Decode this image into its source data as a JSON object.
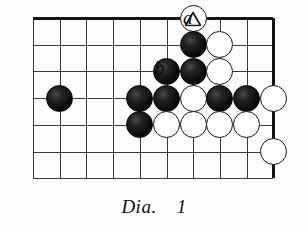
{
  "diagram": {
    "caption_text": "Dia.",
    "caption_number": "1",
    "board": {
      "columns": 10,
      "rows": 7,
      "x_start": 33,
      "y_start": 18,
      "spacing_x": 26.7,
      "spacing_y": 26.7,
      "edge_top_thick": true,
      "edge_right_thick": true,
      "grid_color": "#1a1a1a",
      "background_color": "#fdfdfc"
    },
    "stone_colors": {
      "black": "#0c0c0c",
      "white": "#ffffff",
      "outline": "#151515"
    },
    "stone_diameter": 27,
    "stones": [
      {
        "name": "white-triangle-stone",
        "color": "white",
        "col": 6,
        "row": 0,
        "mark": "triangle"
      },
      {
        "name": "black-stone",
        "color": "black",
        "col": 6,
        "row": 1,
        "mark": ""
      },
      {
        "name": "white-stone",
        "color": "white",
        "col": 7,
        "row": 1,
        "mark": ""
      },
      {
        "name": "black-stone",
        "color": "black",
        "col": 5,
        "row": 2,
        "mark": ""
      },
      {
        "name": "black-stone",
        "color": "black",
        "col": 6,
        "row": 2,
        "mark": ""
      },
      {
        "name": "white-stone",
        "color": "white",
        "col": 7,
        "row": 2,
        "mark": ""
      },
      {
        "name": "black-stone",
        "color": "black",
        "col": 1,
        "row": 3,
        "mark": ""
      },
      {
        "name": "black-stone",
        "color": "black",
        "col": 4,
        "row": 3,
        "mark": ""
      },
      {
        "name": "black-stone",
        "color": "black",
        "col": 5,
        "row": 3,
        "mark": ""
      },
      {
        "name": "white-stone",
        "color": "white",
        "col": 6,
        "row": 3,
        "mark": ""
      },
      {
        "name": "black-stone",
        "color": "black",
        "col": 7,
        "row": 3,
        "mark": ""
      },
      {
        "name": "black-stone",
        "color": "black",
        "col": 8,
        "row": 3,
        "mark": ""
      },
      {
        "name": "white-stone",
        "color": "white",
        "col": 9,
        "row": 3,
        "mark": ""
      },
      {
        "name": "black-stone",
        "color": "black",
        "col": 4,
        "row": 4,
        "mark": ""
      },
      {
        "name": "white-stone",
        "color": "white",
        "col": 5,
        "row": 4,
        "mark": ""
      },
      {
        "name": "white-stone",
        "color": "white",
        "col": 6,
        "row": 4,
        "mark": ""
      },
      {
        "name": "white-stone",
        "color": "white",
        "col": 7,
        "row": 4,
        "mark": ""
      },
      {
        "name": "white-stone",
        "color": "white",
        "col": 8,
        "row": 4,
        "mark": ""
      },
      {
        "name": "white-stone",
        "color": "white",
        "col": 9,
        "row": 5,
        "mark": ""
      }
    ],
    "point_labels": [
      {
        "name": "point-label-a",
        "text": "a",
        "x": 183,
        "y": 8,
        "font_size": 19
      },
      {
        "name": "point-label-b",
        "text": "b",
        "x": 155,
        "y": 58,
        "font_size": 19
      }
    ]
  }
}
